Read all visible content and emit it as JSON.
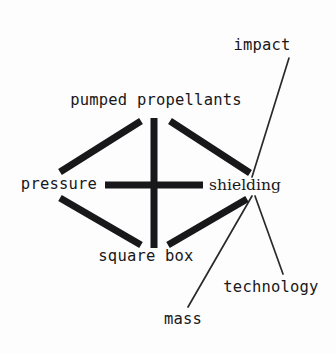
{
  "diagram": {
    "type": "concept-map",
    "title": "",
    "background_color": "#fdfdfd",
    "ink_color": "#18181a",
    "nodes": [
      {
        "id": "pumped-propellants",
        "label": "pumped propellants",
        "x": 156,
        "y": 101,
        "font": "mono"
      },
      {
        "id": "pressure",
        "label": "pressure",
        "x": 59,
        "y": 185,
        "font": "mono"
      },
      {
        "id": "shielding",
        "label": "shielding",
        "x": 245,
        "y": 186,
        "font": "serif"
      },
      {
        "id": "square-box",
        "label": "square box",
        "x": 146,
        "y": 257,
        "font": "mono"
      },
      {
        "id": "impact",
        "label": "impact",
        "x": 262,
        "y": 46,
        "font": "mono"
      },
      {
        "id": "technology",
        "label": "technology",
        "x": 271,
        "y": 288,
        "font": "mono"
      },
      {
        "id": "mass",
        "label": "mass",
        "x": 183,
        "y": 320,
        "font": "mono"
      }
    ],
    "edges": [
      {
        "id": "edge-pressure-pumped",
        "from": "pressure",
        "to": "pumped-propellants",
        "weight": "thick",
        "x1": 60,
        "y1": 172,
        "x2": 141,
        "y2": 121
      },
      {
        "id": "edge-pumped-shielding",
        "from": "pumped-propellants",
        "to": "shielding",
        "weight": "thick",
        "x1": 170,
        "y1": 121,
        "x2": 250,
        "y2": 173
      },
      {
        "id": "edge-pressure-square",
        "from": "pressure",
        "to": "square-box",
        "weight": "thick",
        "x1": 60,
        "y1": 198,
        "x2": 141,
        "y2": 245
      },
      {
        "id": "edge-square-shielding",
        "from": "square-box",
        "to": "shielding",
        "weight": "thick",
        "x1": 168,
        "y1": 245,
        "x2": 247,
        "y2": 199
      },
      {
        "id": "edge-pressure-shielding",
        "from": "pressure",
        "to": "shielding",
        "weight": "thick",
        "x1": 105,
        "y1": 185,
        "x2": 203,
        "y2": 185
      },
      {
        "id": "edge-pumped-square",
        "from": "pumped-propellants",
        "to": "square-box",
        "weight": "thick",
        "x1": 154,
        "y1": 118,
        "x2": 154,
        "y2": 248
      },
      {
        "id": "edge-impact-shielding",
        "from": "impact",
        "to": "shielding",
        "weight": "thin",
        "x1": 289,
        "y1": 58,
        "x2": 252,
        "y2": 177
      },
      {
        "id": "edge-mass-shielding",
        "from": "mass",
        "to": "shielding",
        "weight": "thin",
        "x1": 188,
        "y1": 307,
        "x2": 252,
        "y2": 196
      },
      {
        "id": "edge-technology-shielding",
        "from": "technology",
        "to": "shielding",
        "weight": "thin",
        "x1": 283,
        "y1": 274,
        "x2": 255,
        "y2": 196
      }
    ],
    "stroke_widths": {
      "thick": 7,
      "thin": 1.6
    }
  }
}
